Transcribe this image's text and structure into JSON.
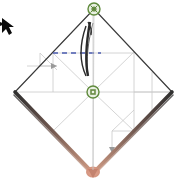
{
  "app": {
    "view_name": "wireframe-viewport",
    "background_color": "#ffffff"
  },
  "geometry": {
    "shape_name": "diamond-wireframe",
    "vertices": {
      "top": {
        "x": 94,
        "y": 9,
        "label": "top-vertex"
      },
      "right": {
        "x": 172,
        "y": 92,
        "label": "right-vertex"
      },
      "bottom": {
        "x": 93,
        "y": 173,
        "label": "bottom-vertex"
      },
      "left": {
        "x": 15,
        "y": 92,
        "label": "left-vertex"
      },
      "center": {
        "x": 93,
        "y": 92,
        "label": "center-vertex"
      }
    },
    "outline_color": "#3a3a3a",
    "guide_color": "#b9b9b9",
    "highlight_color": "#c98a72",
    "highlight_edges": [
      "left-to-bottom",
      "right-to-bottom"
    ]
  },
  "nodes": [
    {
      "name": "node-top",
      "x": 94,
      "y": 9,
      "radius": 6,
      "fill": "#e9f0e2",
      "stroke": "#5f8a3c",
      "inner": "#6d8f4a"
    },
    {
      "name": "node-center",
      "x": 93,
      "y": 92,
      "radius": 6,
      "fill": "#e9f0e2",
      "stroke": "#5f8a3c",
      "inner": "#6d8f4a"
    }
  ],
  "construction": {
    "dashed_line": {
      "name": "blue-dashed-guide",
      "color": "#4a5bb0",
      "x1": 53,
      "y1": 53,
      "x2": 101,
      "y2": 53,
      "dash": "5 4"
    },
    "axis_lines_color": "#bdbdbd",
    "inner_guides_color": "#c4c4c4"
  },
  "curve": {
    "name": "lens-curve",
    "color": "#2b2b2b",
    "description": "narrow dark lens shape below top vertex"
  },
  "cursor": {
    "name": "pointer-arrow",
    "x": 2,
    "y": 18,
    "color": "#0b0b0b"
  },
  "labels": {
    "title": "",
    "status": ""
  }
}
